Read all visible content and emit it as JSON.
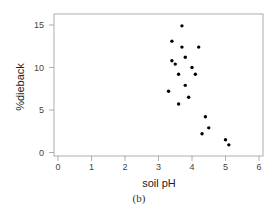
{
  "chart_data": {
    "type": "scatter",
    "title": "",
    "xlabel": "soil pH",
    "ylabel": "%dieback",
    "caption": "(b)",
    "xlim": [
      0,
      6
    ],
    "ylim": [
      0,
      15
    ],
    "xticks": [
      0,
      1,
      2,
      3,
      4,
      5,
      6
    ],
    "yticks": [
      0,
      5,
      10,
      15
    ],
    "grid": false,
    "legend": null,
    "marker_color": "#000000",
    "series": [
      {
        "name": "sites",
        "points": [
          {
            "x": 3.7,
            "y": 14.9
          },
          {
            "x": 3.4,
            "y": 13.1
          },
          {
            "x": 3.7,
            "y": 12.4
          },
          {
            "x": 4.2,
            "y": 12.4
          },
          {
            "x": 3.8,
            "y": 11.2
          },
          {
            "x": 3.4,
            "y": 10.8
          },
          {
            "x": 3.5,
            "y": 10.4
          },
          {
            "x": 4.0,
            "y": 10.0
          },
          {
            "x": 3.6,
            "y": 9.2
          },
          {
            "x": 4.1,
            "y": 9.2
          },
          {
            "x": 3.8,
            "y": 7.9
          },
          {
            "x": 3.3,
            "y": 7.2
          },
          {
            "x": 3.9,
            "y": 6.5
          },
          {
            "x": 3.6,
            "y": 5.7
          },
          {
            "x": 4.4,
            "y": 4.2
          },
          {
            "x": 4.5,
            "y": 2.9
          },
          {
            "x": 4.3,
            "y": 2.2
          },
          {
            "x": 5.0,
            "y": 1.5
          },
          {
            "x": 5.1,
            "y": 0.9
          }
        ]
      }
    ]
  }
}
